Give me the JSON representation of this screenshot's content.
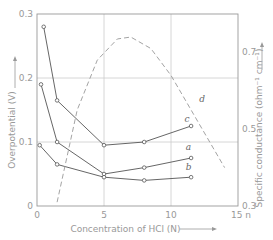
{
  "chart_data": {
    "type": "line",
    "title": "",
    "xlabel": "Concentration of HCl (N)",
    "ylabel": "Overpotential (V)",
    "y2label": "Specific conductance (ohm⁻¹ cm⁻¹)",
    "xlim": [
      0,
      15
    ],
    "ylim": [
      0,
      0.3
    ],
    "y2lim": [
      0.3,
      0.8
    ],
    "x_ticks": [
      "0",
      "5",
      "10",
      "15 n"
    ],
    "y_ticks": [
      "0",
      "0.1",
      "0.2",
      "0.3"
    ],
    "y2_ticks": [
      "0.3",
      "0.5",
      "0.7"
    ],
    "grid": true,
    "series": [
      {
        "name": "a",
        "axis": "left",
        "style": "solid-markers",
        "x": [
          0.3,
          1.5,
          5,
          8,
          11.5
        ],
        "y": [
          0.19,
          0.1,
          0.05,
          0.06,
          0.075
        ]
      },
      {
        "name": "b",
        "axis": "left",
        "style": "solid-markers",
        "x": [
          0.2,
          1.5,
          5,
          8,
          11.5
        ],
        "y": [
          0.095,
          0.065,
          0.045,
          0.04,
          0.045
        ]
      },
      {
        "name": "c",
        "axis": "left",
        "style": "solid-markers",
        "x": [
          0.5,
          1.5,
          5,
          8,
          11.5
        ],
        "y": [
          0.28,
          0.165,
          0.095,
          0.1,
          0.125
        ]
      },
      {
        "name": "d",
        "axis": "right",
        "style": "dashed",
        "x": [
          1.5,
          3,
          4.5,
          6,
          7,
          8.5,
          10,
          11.5,
          12.5,
          14
        ],
        "y": [
          0.31,
          0.55,
          0.68,
          0.735,
          0.74,
          0.71,
          0.64,
          0.55,
          0.49,
          0.4
        ]
      }
    ]
  },
  "labels": {
    "x_axis": "Concentration of HCl (N)",
    "y_axis": "Overpotential (V)",
    "y2_axis": "Specific conductance (ohm⁻¹ cm⁻¹)",
    "curve_a": "a",
    "curve_b": "b",
    "curve_c": "c",
    "curve_d": "d"
  }
}
